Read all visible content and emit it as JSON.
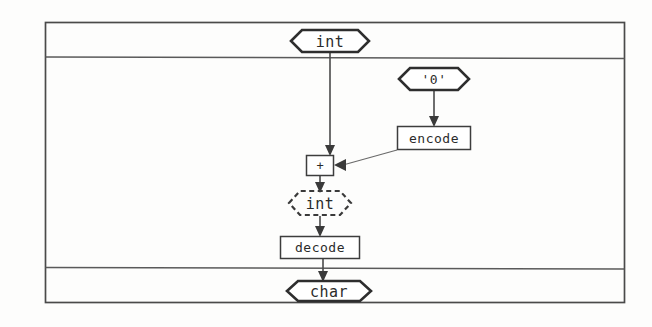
{
  "diagram": {
    "kind": "dataflow-graph",
    "frame": {
      "x": 45,
      "y": 22,
      "width": 580,
      "height": 281
    },
    "bands": [
      {
        "name": "input-band",
        "y_top": 22,
        "y_bottom": 57
      },
      {
        "name": "body-band",
        "y_top": 57,
        "y_bottom": 268
      },
      {
        "name": "output-band",
        "y_top": 268,
        "y_bottom": 303
      }
    ],
    "nodes": [
      {
        "id": "input-int",
        "label": "int",
        "shape": "hexagon",
        "style": "solid",
        "role": "input-port",
        "cx": 330,
        "cy": 41,
        "width": 78,
        "height": 23
      },
      {
        "id": "char-literal-zero",
        "label": "'0'",
        "shape": "hexagon",
        "style": "solid",
        "role": "constant",
        "cx": 434,
        "cy": 79,
        "width": 70,
        "height": 23
      },
      {
        "id": "encode-op",
        "label": "encode",
        "shape": "rectangle",
        "style": "solid",
        "role": "operation",
        "cx": 434,
        "cy": 138,
        "width": 74,
        "height": 24
      },
      {
        "id": "plus-op",
        "label": "+",
        "shape": "rectangle",
        "style": "solid",
        "role": "operation",
        "cx": 320,
        "cy": 165,
        "width": 28,
        "height": 21
      },
      {
        "id": "intermediate-int",
        "label": "int",
        "shape": "hexagon",
        "style": "dashed",
        "role": "intermediate-type",
        "cx": 320,
        "cy": 203,
        "width": 62,
        "height": 24
      },
      {
        "id": "decode-op",
        "label": "decode",
        "shape": "rectangle",
        "style": "solid",
        "role": "operation",
        "cx": 320,
        "cy": 247,
        "width": 80,
        "height": 23
      },
      {
        "id": "output-char",
        "label": "char",
        "shape": "hexagon",
        "style": "solid",
        "role": "output-port",
        "cx": 329,
        "cy": 291,
        "width": 84,
        "height": 21
      }
    ],
    "edges": [
      {
        "id": "edge-int-to-plus",
        "from": "input-int",
        "to": "plus-op",
        "style": "vertical",
        "arrow": "down"
      },
      {
        "id": "edge-zero-to-encode",
        "from": "char-literal-zero",
        "to": "encode-op",
        "style": "vertical",
        "arrow": "down"
      },
      {
        "id": "edge-encode-to-plus",
        "from": "encode-op",
        "to": "plus-op",
        "style": "diagonal",
        "arrow": "left"
      },
      {
        "id": "edge-plus-to-int",
        "from": "plus-op",
        "to": "intermediate-int",
        "style": "vertical",
        "arrow": "down"
      },
      {
        "id": "edge-int-to-decode",
        "from": "intermediate-int",
        "to": "decode-op",
        "style": "vertical",
        "arrow": "down"
      },
      {
        "id": "edge-decode-to-char",
        "from": "decode-op",
        "to": "output-char",
        "style": "vertical",
        "arrow": "down"
      }
    ]
  },
  "colors": {
    "background": "#fdfdfc",
    "stroke_dark": "#2e2e2e",
    "stroke_medium": "#4a4a4a",
    "stroke_light": "#6a6a6a",
    "node_fill": "#ffffff",
    "text": "#2b2b2b"
  }
}
